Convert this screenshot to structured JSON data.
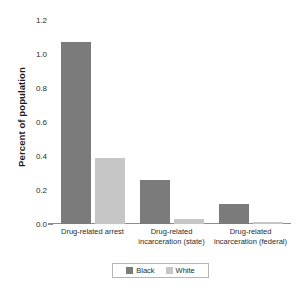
{
  "chart_data": {
    "type": "bar",
    "title": "",
    "xlabel": "",
    "ylabel": "Percent of population",
    "categories": [
      "Drug-related arrest",
      "Drug-related\nincarceration (state)",
      "Drug-related\nincarceration (federal)"
    ],
    "series": [
      {
        "name": "Black",
        "color": "#7b7b7b",
        "values": [
          1.07,
          0.26,
          0.12
        ]
      },
      {
        "name": "White",
        "color": "#c6c6c6",
        "values": [
          0.39,
          0.03,
          0.01
        ]
      }
    ],
    "ylim": [
      0.0,
      1.2
    ],
    "yticks": [
      "0.0",
      "0.2",
      "0.4",
      "0.6",
      "0.8",
      "1.0",
      "1.2"
    ],
    "ytick_values": [
      0.0,
      0.2,
      0.4,
      0.6,
      0.8,
      1.0,
      1.2
    ],
    "grid": false,
    "legend_position": "bottom-center",
    "legend_entries": [
      "Black",
      "White"
    ]
  }
}
